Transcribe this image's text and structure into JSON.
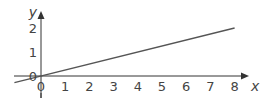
{
  "chart_data": {
    "type": "line",
    "title": "",
    "xlabel": "x",
    "ylabel": "y",
    "x_ticks": [
      "0",
      "1",
      "2",
      "3",
      "4",
      "5",
      "6",
      "7",
      "8"
    ],
    "y_ticks": [
      "0",
      "1",
      "2"
    ],
    "xlim": [
      -1.7,
      8.8
    ],
    "ylim": [
      -1,
      2.7
    ],
    "grid": false,
    "legend": null,
    "series": [
      {
        "name": "y = x/4",
        "equation": "y = 0.25x",
        "x": [
          -1.1,
          0,
          4,
          8
        ],
        "y": [
          -0.28,
          0,
          1,
          2
        ],
        "color": "#555555"
      }
    ],
    "annotations": [
      "Origin labelled 0 on both axes"
    ]
  },
  "colors": {
    "axis": "#333333",
    "line": "#555555",
    "text": "#444444",
    "background": "#ffffff"
  }
}
